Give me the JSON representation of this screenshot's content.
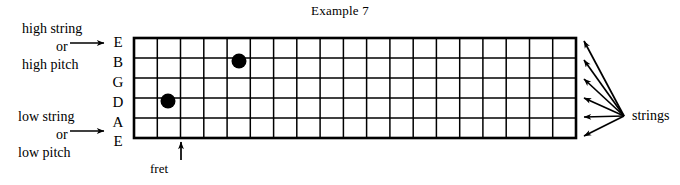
{
  "title": "Example 7",
  "diagram": {
    "kind": "guitar-fretboard",
    "fret_count": 19,
    "string_count": 6,
    "strings_high_to_low": [
      "E",
      "B",
      "G",
      "D",
      "A",
      "E"
    ],
    "grid": {
      "left": 134,
      "right": 576,
      "top": 38,
      "bottom": 138,
      "row_height": 20,
      "fret_width": 23.26
    }
  },
  "annotations": {
    "high": {
      "line1": "high string",
      "line2": "or",
      "line3": "high pitch",
      "points_to_string": "E"
    },
    "low": {
      "line1": "low string",
      "line2": "or",
      "line3": "low pitch",
      "points_to_string": "E"
    },
    "fret_label": "fret",
    "strings_label": "strings"
  },
  "string_labels": [
    {
      "name": "E",
      "y": 43
    },
    {
      "name": "B",
      "y": 63
    },
    {
      "name": "G",
      "y": 83
    },
    {
      "name": "D",
      "y": 103
    },
    {
      "name": "A",
      "y": 123
    },
    {
      "name": "E",
      "y": 142
    }
  ],
  "notes": [
    {
      "string": "B",
      "fret": 5,
      "cx": 239,
      "cy": 61,
      "r": 7.5
    },
    {
      "string": "D",
      "fret": 1,
      "cx": 168,
      "cy": 101,
      "r": 7.5
    }
  ],
  "colors": {
    "ink": "#000000",
    "background": "#ffffff"
  }
}
